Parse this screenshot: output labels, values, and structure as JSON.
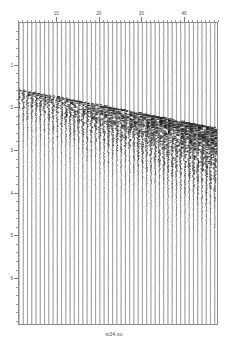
{
  "figure": {
    "title": "",
    "caption": "st34.su",
    "background_color": "#ffffff",
    "frame_color": "#8a8a8a",
    "trace_color": "#000000"
  },
  "chart_data": {
    "type": "line",
    "plot_style": "seismic-wiggle-variable-area",
    "title": "st34.su",
    "xlabel": "",
    "ylabel": "",
    "x": [
      10,
      20,
      30,
      40
    ],
    "categories": [
      "10",
      "20",
      "30",
      "40"
    ],
    "xtick_labels": [
      "10",
      "20",
      "30",
      "40"
    ],
    "xtick_values": [
      10,
      20,
      30,
      40
    ],
    "xlim": [
      1,
      48
    ],
    "x_axis_position": "top",
    "ytick_labels": [
      "1",
      "2",
      "3",
      "4",
      "5",
      "6"
    ],
    "ytick_values": [
      1,
      2,
      3,
      4,
      5,
      6
    ],
    "ylim": [
      0,
      7.1
    ],
    "y_axis_direction": "inverted",
    "y_axis_position": "left",
    "grid": false,
    "legend": "none",
    "n_traces": 48,
    "series": [
      {
        "name": "first-break-moveout",
        "description": "linear direct-arrival moveout picked across traces",
        "x": [
          1,
          10,
          20,
          30,
          40,
          48
        ],
        "values": [
          1.55,
          1.72,
          1.92,
          2.12,
          2.32,
          2.48
        ]
      },
      {
        "name": "reflection-coda",
        "description": "scattered coda energy trailing the first breaks",
        "x": [
          1,
          10,
          20,
          30,
          40,
          48
        ],
        "values": [
          2.05,
          2.25,
          2.55,
          2.9,
          3.25,
          3.5
        ]
      }
    ],
    "annotations": []
  },
  "axes": {
    "top": {
      "name": "trace-number-axis",
      "ticks": [
        {
          "value": 10,
          "label": "10"
        },
        {
          "value": 20,
          "label": "20"
        },
        {
          "value": 30,
          "label": "30"
        },
        {
          "value": 40,
          "label": "40"
        }
      ]
    },
    "left": {
      "name": "time-axis-seconds",
      "ticks": [
        {
          "value": 1,
          "label": "1"
        },
        {
          "value": 2,
          "label": "2"
        },
        {
          "value": 3,
          "label": "3"
        },
        {
          "value": 4,
          "label": "4"
        },
        {
          "value": 5,
          "label": "5"
        },
        {
          "value": 6,
          "label": "6"
        }
      ]
    }
  }
}
